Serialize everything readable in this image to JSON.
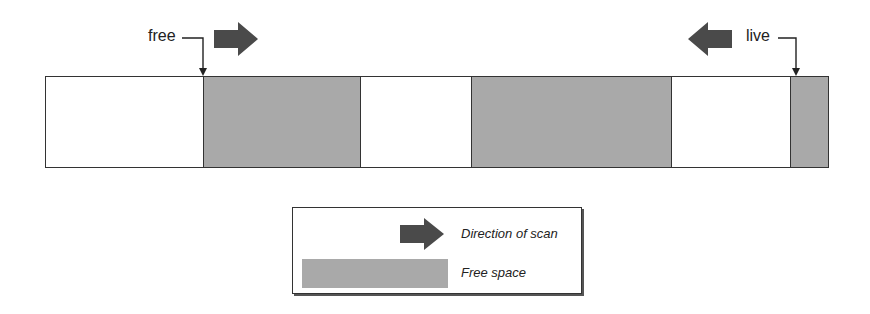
{
  "diagram": {
    "pointers": [
      {
        "label": "free",
        "arrow_direction": "right"
      },
      {
        "label": "live",
        "arrow_direction": "left"
      }
    ],
    "memory_bar": {
      "segments": [
        {
          "type": "used",
          "width": 158
        },
        {
          "type": "free",
          "width": 158
        },
        {
          "type": "used",
          "width": 111
        },
        {
          "type": "free",
          "width": 201
        },
        {
          "type": "used",
          "width": 119
        },
        {
          "type": "free",
          "width": 37
        }
      ]
    },
    "legend": {
      "items": [
        {
          "symbol": "arrow",
          "label": "Direction of scan"
        },
        {
          "symbol": "swatch",
          "label": "Free space"
        }
      ]
    },
    "colors": {
      "free_space": "#a9a9a9",
      "arrow": "#4a4a4a",
      "outline": "#333333"
    }
  }
}
